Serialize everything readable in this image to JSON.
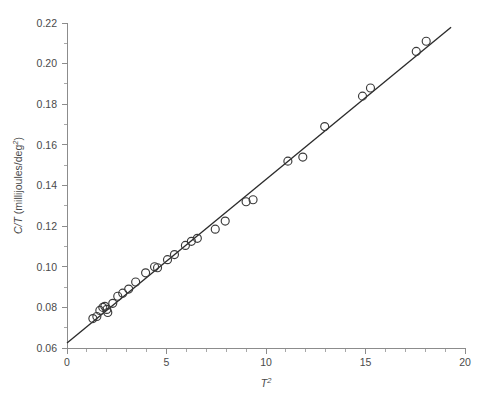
{
  "chart_data": {
    "type": "scatter",
    "title": "",
    "subtitle": "",
    "xlabel": "T²",
    "ylabel": "C/T (millijoules/deg²)",
    "ylabel_parts": {
      "symbol": "C/T",
      "unit": "(millijoules/deg",
      "exponent": "2",
      "unit_close": ")"
    },
    "xlabel_parts": {
      "symbol": "T",
      "exponent": "2"
    },
    "xlim": [
      0,
      20
    ],
    "ylim": [
      0.06,
      0.22
    ],
    "x_ticks": [
      0,
      5,
      10,
      15,
      20
    ],
    "x_tick_labels": [
      "0",
      "5",
      "10",
      "15",
      "20"
    ],
    "x_minor_step": 1,
    "y_ticks": [
      0.06,
      0.08,
      0.1,
      0.12,
      0.14,
      0.16,
      0.18,
      0.2,
      0.22
    ],
    "y_tick_labels": [
      "0.06",
      "0.08",
      "0.10",
      "0.12",
      "0.14",
      "0.16",
      "0.18",
      "0.20",
      "0.22"
    ],
    "y_minor_step": 0.01,
    "grid": false,
    "legend": false,
    "legend_position": "none",
    "marker": "open-circle",
    "marker_size": 4.0,
    "series": [
      {
        "name": "measurements",
        "marker": "open-circle",
        "x": [
          1.3,
          1.5,
          1.65,
          1.8,
          1.9,
          2.0,
          2.05,
          2.3,
          2.55,
          2.8,
          3.1,
          3.45,
          3.95,
          4.4,
          4.55,
          5.05,
          5.4,
          5.95,
          6.25,
          6.55,
          7.45,
          7.95,
          9.0,
          9.35,
          11.1,
          11.85,
          12.95,
          14.85,
          15.25,
          17.55,
          18.05
        ],
        "y": [
          0.0745,
          0.0755,
          0.0785,
          0.08,
          0.0805,
          0.079,
          0.0775,
          0.082,
          0.0855,
          0.087,
          0.089,
          0.0925,
          0.097,
          0.1,
          0.0995,
          0.1035,
          0.106,
          0.1105,
          0.1125,
          0.114,
          0.1185,
          0.1225,
          0.132,
          0.133,
          0.152,
          0.154,
          0.169,
          0.184,
          0.188,
          0.206,
          0.211
        ]
      }
    ],
    "fit_line": {
      "name": "least-squares fit",
      "intercept": 0.0625,
      "slope": 0.00805,
      "x_start": 0.0,
      "x_end": 19.3,
      "y_start": 0.0625,
      "y_end": 0.2179
    }
  },
  "figure": {
    "background_color": "#ffffff",
    "axis_color": "#8c8c8c",
    "marker_color": "#3a3a3a",
    "line_color": "#2b2b2b",
    "text_color": "#4a4a4a"
  }
}
